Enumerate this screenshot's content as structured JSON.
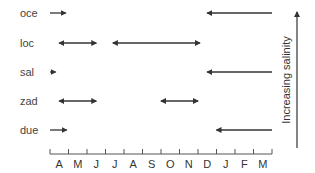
{
  "diagram": {
    "type": "timeline-arrows",
    "months": [
      "A",
      "M",
      "J",
      "J",
      "A",
      "S",
      "O",
      "N",
      "D",
      "J",
      "F",
      "M"
    ],
    "right_axis_label": "Increasing salinity",
    "rows": [
      {
        "label": "oce",
        "y": 13,
        "segments": [
          {
            "from": 0.0,
            "to": 0.85,
            "dir": "right"
          },
          {
            "from": 8.5,
            "to": 12.0,
            "dir": "left"
          }
        ]
      },
      {
        "label": "loc",
        "y": 43,
        "segments": [
          {
            "from": 0.5,
            "to": 2.5,
            "dir": "both"
          },
          {
            "from": 3.4,
            "to": 8.1,
            "dir": "both"
          }
        ]
      },
      {
        "label": "sal",
        "y": 72,
        "segments": [
          {
            "from": 0.0,
            "to": 0.3,
            "dir": "right"
          },
          {
            "from": 8.5,
            "to": 12.0,
            "dir": "left"
          }
        ]
      },
      {
        "label": "zad",
        "y": 101,
        "segments": [
          {
            "from": 0.5,
            "to": 2.5,
            "dir": "both"
          },
          {
            "from": 6.0,
            "to": 8.0,
            "dir": "both"
          }
        ]
      },
      {
        "label": "due",
        "y": 130,
        "segments": [
          {
            "from": 0.0,
            "to": 0.9,
            "dir": "right"
          },
          {
            "from": 9.0,
            "to": 12.0,
            "dir": "left"
          }
        ]
      }
    ],
    "colors": {
      "arrow": "#333333",
      "axis": "#555555",
      "text": "#444444"
    }
  }
}
